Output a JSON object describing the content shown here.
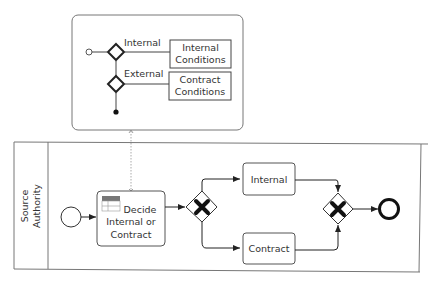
{
  "decision_panel": {
    "branches": [
      {
        "label": "Internal",
        "condition_line1": "Internal",
        "condition_line2": "Conditions"
      },
      {
        "label": "External",
        "condition_line1": "Contract",
        "condition_line2": "Conditions"
      }
    ]
  },
  "pool": {
    "lane_label_line1": "Source",
    "lane_label_line2": "Authority"
  },
  "tasks": {
    "decide_line1": "Decide",
    "decide_line2": "Internal or",
    "decide_line3": "Contract",
    "internal": "Internal",
    "contract": "Contract"
  },
  "colors": {
    "stroke": "#333333",
    "border": "#888888"
  }
}
